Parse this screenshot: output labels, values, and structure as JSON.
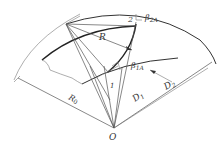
{
  "diagram": {
    "type": "impeller blade geometry (arc blade construction)",
    "labels": {
      "point_2": "2",
      "beta_2A": "β",
      "beta_2A_sub": "2A",
      "beta_1A": "β",
      "beta_1A_sub": "1A",
      "point_1": "1",
      "R": "R",
      "R0": "R",
      "R0_sub": "0",
      "D1": "D",
      "D1_sub": "1",
      "D2": "D",
      "D2_sub": "2",
      "O": "O"
    },
    "colors": {
      "line": "#555555",
      "bold_line": "#222222",
      "background": "#ffffff"
    }
  }
}
